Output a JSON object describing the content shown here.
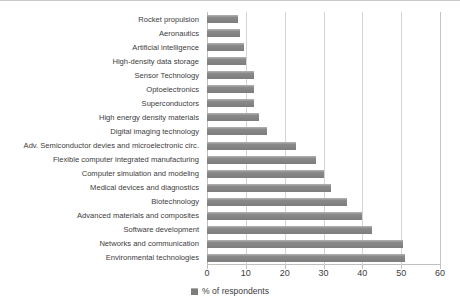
{
  "chart_data": {
    "type": "bar",
    "orientation": "horizontal",
    "title": "",
    "xlabel": "",
    "ylabel": "",
    "xlim": [
      0,
      60
    ],
    "xticks": [
      0,
      10,
      20,
      30,
      40,
      50,
      60
    ],
    "grid": true,
    "legend_position": "bottom",
    "legend": [
      "% of respondents"
    ],
    "series_name": "% of respondents",
    "bar_color": "#7d7d7d",
    "grid_color": "#d4d4d4",
    "axis_color": "#bfbfbf",
    "text_color": "#3d3d3d",
    "categories": [
      "Rocket propulsion",
      "Aeronautics",
      "Artificial intelligence",
      "High-density data storage",
      "Sensor Technology",
      "Optoelectronics",
      "Superconductors",
      "High energy density materials",
      "Digital imaging technology",
      "Adv. Semiconductor devies and microelectronic circ.",
      "Flexible computer integrated manufacturing",
      "Computer simulation and modeling",
      "Medical devices and diagnostics",
      "Biotechnology",
      "Advanced materials and composites",
      "Software development",
      "Networks and communication",
      "Environmental technologies"
    ],
    "values": [
      8,
      8.5,
      9.5,
      10,
      12,
      12,
      12,
      13.5,
      15.5,
      23,
      28,
      30,
      32,
      36,
      40,
      42.5,
      50.5,
      51
    ]
  }
}
